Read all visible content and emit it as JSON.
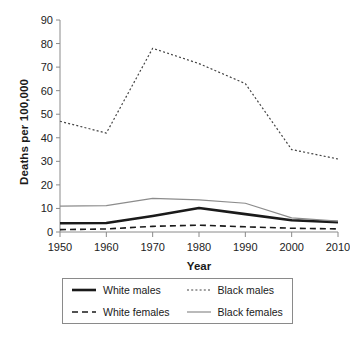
{
  "chart_data": {
    "type": "line",
    "title": "",
    "xlabel": "Year",
    "ylabel": "Deaths per 100,000",
    "x": [
      1950,
      1960,
      1970,
      1980,
      1990,
      2000,
      2010
    ],
    "xticklabels": [
      "1950",
      "1960",
      "1970",
      "1980",
      "1990",
      "2000",
      "2010"
    ],
    "yticklabels": [
      "0",
      "10",
      "20",
      "30",
      "40",
      "50",
      "60",
      "70",
      "80",
      "90"
    ],
    "yticks": [
      0,
      10,
      20,
      30,
      40,
      50,
      60,
      70,
      80,
      90
    ],
    "xlim": [
      1950,
      2010
    ],
    "ylim": [
      0,
      90
    ],
    "grid": false,
    "legend_position": "below-axes",
    "series": [
      {
        "name": "White males",
        "style": "solid-thick",
        "color": "#1a1a1a",
        "values": [
          3.7,
          3.8,
          6.8,
          10.2,
          7.6,
          5.0,
          4.2
        ]
      },
      {
        "name": "Black males",
        "style": "dotted",
        "color": "#444444",
        "values": [
          47.0,
          42.0,
          78.0,
          71.5,
          63.0,
          35.0,
          31.0
        ]
      },
      {
        "name": "White females",
        "style": "dashed",
        "color": "#1a1a1a",
        "values": [
          1.0,
          1.3,
          2.4,
          2.9,
          2.2,
          1.6,
          1.3
        ]
      },
      {
        "name": "Black females",
        "style": "solid-thin",
        "color": "#8c8c8c",
        "values": [
          11.0,
          11.2,
          14.3,
          13.6,
          12.2,
          6.0,
          4.6
        ]
      }
    ]
  },
  "axis": {
    "ylabel": "Deaths per 100,000",
    "xlabel": "Year"
  },
  "legend": {
    "items": [
      {
        "label": "White males",
        "style": "solid-thick"
      },
      {
        "label": "Black males",
        "style": "dotted"
      },
      {
        "label": "White females",
        "style": "dashed"
      },
      {
        "label": "Black females",
        "style": "solid-thin"
      }
    ]
  }
}
